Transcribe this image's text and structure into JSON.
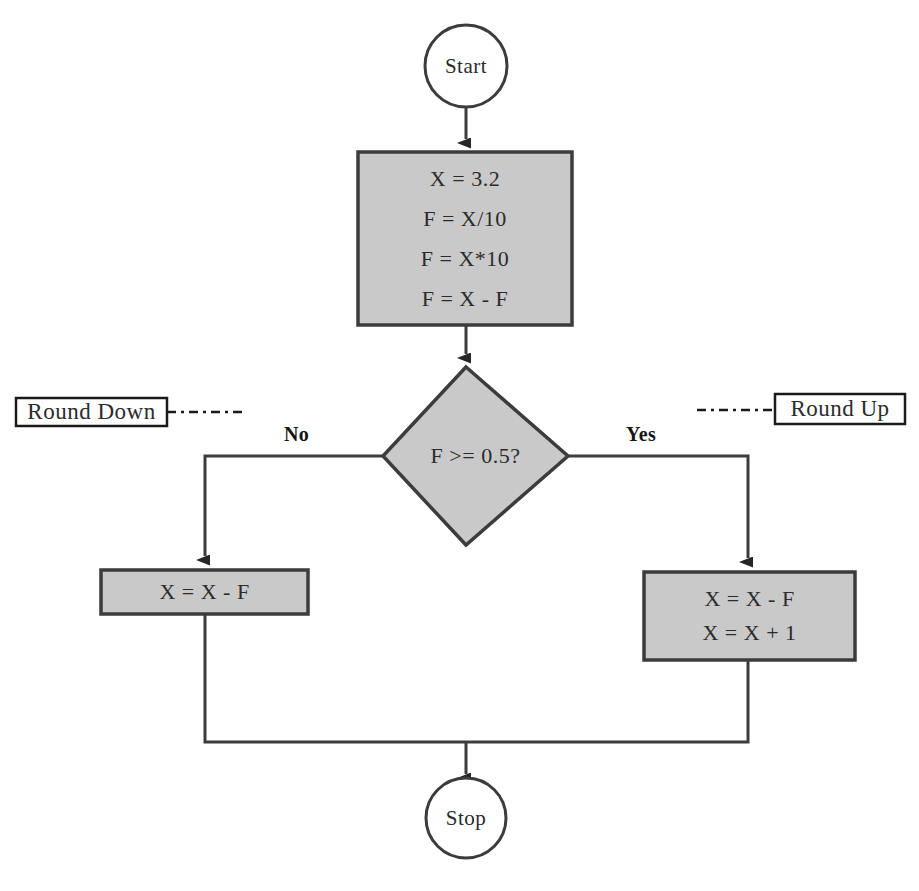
{
  "diagram": {
    "type": "flowchart",
    "colors": {
      "background": "#ffffff",
      "node_fill": "#c9c9c9",
      "node_stroke": "#3c3c3c",
      "annotation_fill": "#ffffff",
      "annotation_stroke": "#1a1a1a",
      "connector": "#3c3c3c",
      "text": "#2b2b2b"
    },
    "nodes": {
      "start": {
        "shape": "terminator-circle",
        "label": "Start"
      },
      "init_process": {
        "shape": "process-rect",
        "lines": [
          "X = 3.2",
          "F = X/10",
          "F = X*10",
          "F = X - F"
        ]
      },
      "decision": {
        "shape": "decision-diamond",
        "label": "F >= 0.5?"
      },
      "round_down_process": {
        "shape": "process-rect",
        "lines": [
          "X = X - F"
        ]
      },
      "round_up_process": {
        "shape": "process-rect",
        "lines": [
          "X = X - F",
          "X = X + 1"
        ]
      },
      "stop": {
        "shape": "terminator-circle",
        "label": "Stop"
      }
    },
    "branch_labels": {
      "no": "No",
      "yes": "Yes"
    },
    "annotations": {
      "left": {
        "label": "Round Down",
        "connector": "dashed"
      },
      "right": {
        "label": "Round Up",
        "connector": "dashed"
      }
    }
  }
}
